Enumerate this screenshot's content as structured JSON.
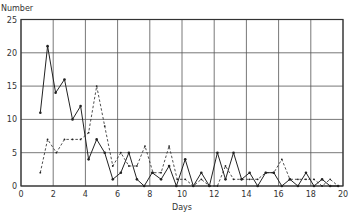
{
  "chart_data": {
    "type": "line",
    "title": "",
    "xlabel": "Days",
    "ylabel": "Number",
    "xlim": [
      0,
      20
    ],
    "ylim": [
      0,
      25
    ],
    "x_ticks": [
      0,
      2,
      4,
      6,
      8,
      10,
      12,
      14,
      16,
      18,
      20
    ],
    "y_ticks": [
      0,
      5,
      10,
      15,
      20,
      25
    ],
    "grid": true,
    "legend": null,
    "series": [
      {
        "name": "solid",
        "style": "solid",
        "markers": true,
        "x": [
          1.2,
          1.65,
          2.15,
          2.7,
          3.2,
          3.7,
          4.2,
          4.7,
          5.2,
          5.7,
          6.2,
          6.7,
          7.2,
          7.65,
          8.15,
          8.7,
          9.2,
          9.65,
          10.2,
          10.7,
          11.2,
          11.7,
          12.2,
          12.7,
          13.2,
          13.7,
          14.2,
          14.7,
          15.2,
          15.7,
          16.2,
          16.7,
          17.2,
          17.7,
          18.2,
          18.7,
          19.2,
          19.7
        ],
        "values": [
          11,
          21,
          14,
          16,
          10,
          12,
          4,
          7,
          5,
          1,
          2,
          5,
          1,
          0,
          2,
          1,
          3,
          0,
          4,
          0,
          2,
          0,
          5,
          1,
          5,
          1,
          2,
          0,
          2,
          2,
          0,
          1,
          0,
          2,
          0,
          1,
          0,
          0
        ]
      },
      {
        "name": "dashed",
        "style": "dashed",
        "markers": true,
        "x": [
          1.2,
          1.65,
          2.2,
          2.7,
          3.2,
          3.7,
          4.2,
          4.7,
          5.2,
          5.7,
          6.2,
          6.7,
          7.2,
          7.7,
          8.2,
          8.7,
          9.2,
          9.7,
          10.2,
          10.7,
          11.2,
          11.7,
          12.2,
          12.7,
          13.2,
          13.7,
          14.2,
          14.7,
          15.2,
          15.7,
          16.2,
          16.7,
          17.2,
          17.7,
          18.2,
          18.7,
          19.2,
          19.7
        ],
        "values": [
          2,
          7,
          5,
          7,
          7,
          7,
          8,
          15,
          9,
          3,
          5,
          3,
          3,
          6,
          2,
          2,
          6,
          1,
          1,
          0,
          1,
          0,
          0,
          3,
          1,
          1,
          1,
          1,
          2,
          2,
          4,
          1,
          1,
          1,
          1,
          0,
          1,
          0
        ]
      }
    ]
  },
  "plot": {
    "left": 21,
    "right": 343,
    "top": 19.5,
    "bottom": 186,
    "line_color": "#222222",
    "grid_color": "#555555"
  }
}
